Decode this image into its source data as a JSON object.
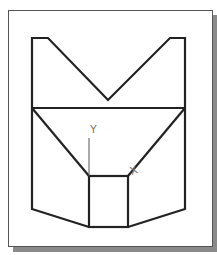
{
  "diagram": {
    "type": "2d-cad-sketch",
    "colors": {
      "outline": "#222222",
      "axis": "#666666",
      "frame_border": "#555555",
      "frame_shadow": "#8a8a8a",
      "background": "#ffffff"
    },
    "axes": {
      "y_label": "Y",
      "x_label": "X"
    },
    "shape": {
      "description": "Symmetric profile: V-notched top, horizontal divider, converging diagonals into a center square, flared lower sides"
    }
  }
}
